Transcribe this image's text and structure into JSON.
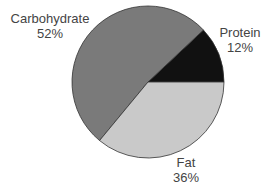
{
  "chart_data": {
    "type": "pie",
    "title": "",
    "categories": [
      "Carbohydrate",
      "Protein",
      "Fat"
    ],
    "values": [
      52,
      12,
      36
    ],
    "unit": "%",
    "colors": {
      "Carbohydrate": "#7a7a7a",
      "Protein": "#111111",
      "Fat": "#c9c9c9"
    },
    "labels": [
      {
        "name": "Carbohydrate",
        "value_text": "52%"
      },
      {
        "name": "Protein",
        "value_text": "12%"
      },
      {
        "name": "Fat",
        "value_text": "36%"
      }
    ],
    "start_angle_deg": 0,
    "direction": "counterclockwise",
    "legend": "none"
  }
}
